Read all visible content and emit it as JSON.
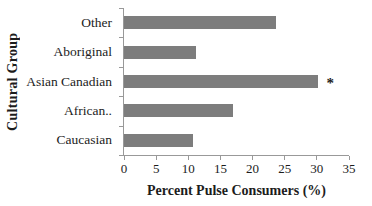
{
  "chart_data": {
    "type": "bar",
    "orientation": "horizontal",
    "title": "",
    "xlabel": "Percent Pulse Consumers (%)",
    "ylabel": "Cultural Group",
    "categories": [
      "Other",
      "Aboriginal",
      "Asian Canadian",
      "African..",
      "Caucasian"
    ],
    "values": [
      23.6,
      11.2,
      30.1,
      17,
      10.8
    ],
    "xlim": [
      0,
      35
    ],
    "x_ticks": [
      0,
      5,
      10,
      15,
      20,
      25,
      30,
      35
    ],
    "annotations": [
      {
        "category": "Asian Canadian",
        "text": "*"
      }
    ],
    "legend": false,
    "grid": false,
    "bar_color": "#7d7d7d",
    "axis_color": "#999999",
    "text_color": "#1c1c1c"
  }
}
